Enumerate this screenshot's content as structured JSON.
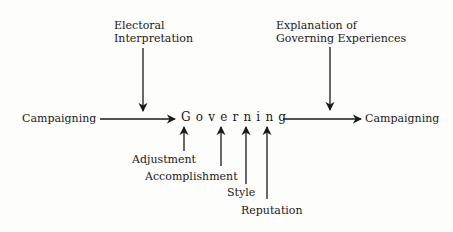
{
  "diagram": {
    "center": {
      "label": "Governing"
    },
    "inputs_top": [
      {
        "line1": "Electoral",
        "line2": "Interpretation"
      },
      {
        "line1": "Explanation of",
        "line2": "Governing Experiences"
      }
    ],
    "flow": {
      "left": "Campaigning",
      "right": "Campaigning"
    },
    "inputs_bottom": [
      {
        "label": "Adjustment"
      },
      {
        "label": "Accomplishment"
      },
      {
        "label": "Style"
      },
      {
        "label": "Reputation"
      }
    ],
    "colors": {
      "ink": "#1a1a1a",
      "background": "#fdfdfc"
    }
  }
}
